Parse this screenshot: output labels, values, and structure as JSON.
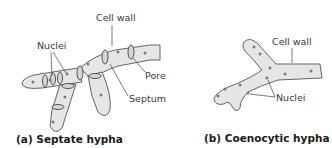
{
  "diagram": {
    "panel_a": {
      "caption": "(a) Septate hypha",
      "labels": {
        "cell_wall": "Cell wall",
        "nuclei": "Nuclei",
        "pore": "Pore",
        "septum": "Septum"
      }
    },
    "panel_b": {
      "caption": "(b) Coenocytic hypha",
      "labels": {
        "cell_wall": "Cell wall",
        "nuclei": "Nuclei"
      }
    },
    "colors": {
      "hypha_fill": "#e6e6e6",
      "outline": "#555555",
      "nucleus": "#7a7a7a",
      "text": "#3a3a3a"
    }
  }
}
